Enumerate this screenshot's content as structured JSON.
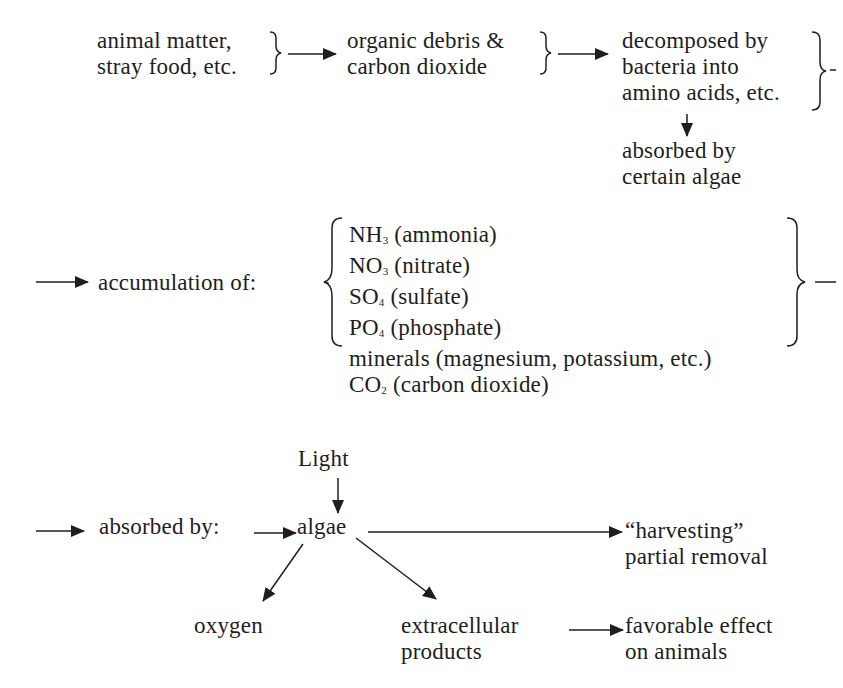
{
  "header": {
    "partial_text": ""
  },
  "row1": {
    "node1": {
      "lines": [
        "animal matter,",
        "stray food, etc."
      ]
    },
    "node2": {
      "lines": [
        "organic debris  &",
        "carbon dioxide"
      ]
    },
    "node3": {
      "lines": [
        "decomposed by",
        "bacteria into",
        "amino acids, etc."
      ]
    },
    "node4": {
      "lines": [
        "absorbed by",
        "certain algae"
      ]
    }
  },
  "row2": {
    "label": "accumulation of:",
    "items": [
      {
        "formula": "NH",
        "sub": "3",
        "desc": " (ammonia)"
      },
      {
        "formula": "NO",
        "sub": "3",
        "desc": " (nitrate)"
      },
      {
        "formula": "SO",
        "sub": "4",
        "desc": " (sulfate)"
      },
      {
        "formula": "PO",
        "sub": "4",
        "desc": " (phosphate)"
      },
      {
        "formula": "minerals",
        "sub": "",
        "desc": " (magnesium, potassium, etc.)"
      },
      {
        "formula": "CO",
        "sub": "2",
        "desc": " (carbon dioxide)"
      }
    ]
  },
  "row3": {
    "absorbed_label": "absorbed by:",
    "light": "Light",
    "algae": "algae",
    "harvest": {
      "lines": [
        "“harvesting”",
        "partial removal"
      ]
    },
    "oxygen": "oxygen",
    "extracellular": {
      "lines": [
        "extracellular",
        "products"
      ]
    },
    "favorable": {
      "lines": [
        "favorable effect",
        "on animals"
      ]
    }
  },
  "colors": {
    "ink": "#1e1e1e",
    "background": "#ffffff"
  }
}
